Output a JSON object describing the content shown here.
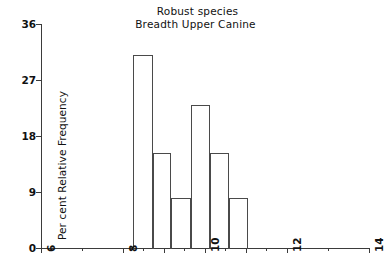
{
  "chart_data": {
    "type": "bar",
    "title": "Robust species\nBreadth Upper Canine",
    "title_lines": [
      "Robust species",
      "Breadth Upper Canine"
    ],
    "xlabel": "",
    "ylabel": "Per cent Relative Frequency",
    "xlim": [
      6,
      14
    ],
    "ylim": [
      0,
      36
    ],
    "grid": false,
    "legend": null,
    "x_ticks": [
      6,
      8,
      10,
      12,
      14
    ],
    "x_tick_labels": [
      "6",
      "8",
      "10",
      "12",
      "14"
    ],
    "y_ticks": [
      0,
      9,
      18,
      27,
      36
    ],
    "y_tick_labels": [
      "0",
      "9",
      "18",
      "27",
      "36"
    ],
    "bin_edges": [
      8.25,
      8.72,
      9.18,
      9.65,
      10.12,
      10.58,
      11.05
    ],
    "categories": [
      "8.25-8.72",
      "8.72-9.18",
      "9.18-9.65",
      "9.65-10.12",
      "10.12-10.58",
      "10.58-11.05"
    ],
    "values": [
      31.0,
      15.3,
      8.0,
      23.0,
      15.3,
      8.0
    ],
    "bar_color": "#ffffff",
    "bar_edge_color": "#4a4a4a",
    "axis_color": "#3b3b3b"
  },
  "axes": {
    "y_title": "Per cent Relative Frequency"
  }
}
